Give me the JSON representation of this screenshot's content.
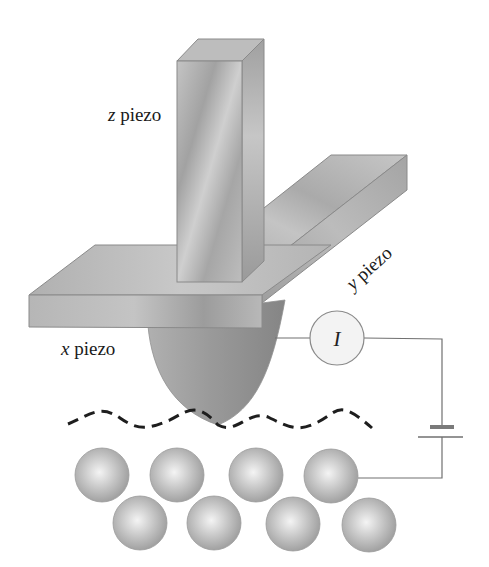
{
  "diagram": {
    "labels": {
      "z_piezo": {
        "var": "z",
        "text": " piezo"
      },
      "y_piezo": {
        "var": "y",
        "text": " piezo"
      },
      "x_piezo": {
        "var": "x",
        "text": " piezo"
      },
      "current_meter": "I"
    },
    "elements": {
      "piezo_blocks": [
        "z piezo (vertical bar)",
        "x piezo (horizontal slab)",
        "y piezo (diagonal slab)"
      ],
      "tip": "probe tip",
      "path": "dashed tip trajectory",
      "circuit": [
        "ammeter I",
        "battery",
        "wires"
      ],
      "atoms_top_row": 4,
      "atoms_bottom_row": 4
    },
    "colors": {
      "metal_light": "#c9c9c9",
      "metal_mid": "#a8a8a8",
      "metal_dark": "#8a8a8a",
      "edge": "#7a7a7a",
      "wire": "#707070",
      "dash": "#1e1e1e",
      "meter_fill": "#f2f2f2"
    }
  }
}
